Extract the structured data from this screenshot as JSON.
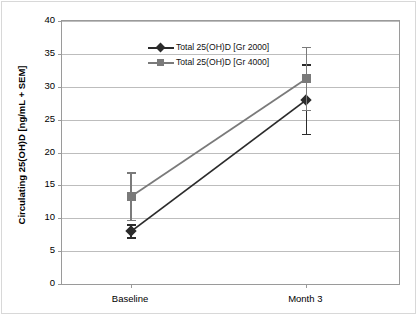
{
  "chart_data": {
    "type": "line",
    "title": "",
    "xlabel": "",
    "ylabel": "Circulating 25(OH)D [ng/mL + SEM]",
    "categories": [
      "Baseline",
      "Month 3"
    ],
    "ylim": [
      0,
      40
    ],
    "yticks": [
      0,
      5,
      10,
      15,
      20,
      25,
      30,
      35,
      40
    ],
    "ytick_labels": [
      "0",
      "5",
      "10",
      "15",
      "20",
      "25",
      "30",
      "35",
      "40"
    ],
    "grid": "horizontal",
    "legend_position": "top-left-inside",
    "series": [
      {
        "name": "Total 25(OH)D [Gr 2000]",
        "marker": "diamond",
        "color": "#2b2b2b",
        "values": [
          8.0,
          28.0
        ],
        "errors": [
          1.0,
          5.3
        ]
      },
      {
        "name": "Total 25(OH)D [Gr 4000]",
        "marker": "square",
        "color": "#7a7a7a",
        "values": [
          13.3,
          31.2
        ],
        "errors": [
          3.6,
          4.8
        ]
      }
    ]
  },
  "colors": {
    "series_2000": "#2b2b2b",
    "series_4000": "#7a7a7a",
    "gridline": "#bdbdbd",
    "axis": "#9a9a9a",
    "frame": "#d8d8d8",
    "background": "#ffffff",
    "text": "#000000"
  }
}
